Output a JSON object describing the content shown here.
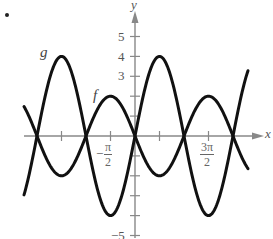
{
  "figure": {
    "bullet": "•",
    "axis_labels": {
      "x": "x",
      "y": "y"
    },
    "y_tick_labels": [
      {
        "value": 5,
        "text": "5"
      },
      {
        "value": 4,
        "text": "4"
      },
      {
        "value": 3,
        "text": "3"
      },
      {
        "value": -5,
        "text": "−5"
      }
    ],
    "x_tick_labels": [
      {
        "value": "-pi/2",
        "num": "π",
        "sign": "−",
        "den": "2"
      },
      {
        "value": "3pi/2",
        "num": "3π",
        "sign": "",
        "den": "2"
      }
    ],
    "curve_labels": {
      "g": "g",
      "f": "f"
    },
    "colors": {
      "curve": "#111111",
      "axis": "#888888",
      "text": "#555555"
    }
  },
  "chart_data": {
    "type": "line",
    "title": "",
    "xlabel": "x",
    "ylabel": "y",
    "xlim": [
      -5.9,
      7.2
    ],
    "ylim": [
      -5,
      5
    ],
    "x_ticks": [
      "-2π",
      "-3π/2",
      "-π",
      "-π/2",
      "0",
      "π/2",
      "π",
      "3π/2",
      "2π"
    ],
    "x_tick_labels_shown": [
      "-π/2",
      "3π/2"
    ],
    "y_ticks": [
      -5,
      -4,
      -3,
      -2,
      -1,
      0,
      1,
      2,
      3,
      4,
      5
    ],
    "y_tick_labels_shown": [
      5,
      4,
      3,
      -5
    ],
    "grid": false,
    "series": [
      {
        "name": "g",
        "expression": "4 sin x",
        "x": [
          "-2π",
          "-3π/2",
          "-π",
          "-π/2",
          "0",
          "π/2",
          "π",
          "3π/2",
          "2π"
        ],
        "values": [
          0,
          4,
          0,
          -4,
          0,
          4,
          0,
          -4,
          0
        ]
      },
      {
        "name": "f",
        "expression": "-2 sin x",
        "x": [
          "-2π",
          "-3π/2",
          "-π",
          "-π/2",
          "0",
          "π/2",
          "π",
          "3π/2",
          "2π"
        ],
        "values": [
          0,
          -2,
          0,
          2,
          0,
          -2,
          0,
          2,
          0
        ]
      }
    ]
  }
}
